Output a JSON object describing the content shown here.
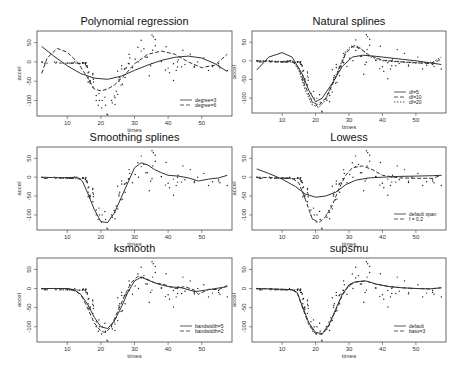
{
  "figure": {
    "width": 470,
    "height": 371,
    "background": "#ffffff",
    "line_color": "#333333",
    "point_color": "#222222"
  },
  "chart_data": [
    {
      "type": "scatter",
      "title": "Polynomial regression",
      "xlabel": "times",
      "ylabel": "accel",
      "xlim": [
        1,
        59
      ],
      "ylim": [
        -140,
        80
      ],
      "xticks": [
        10,
        20,
        30,
        40,
        50
      ],
      "yticks": [
        50,
        0,
        -50,
        -100
      ],
      "frame": {
        "x": 37,
        "y": 31,
        "w": 195,
        "h": 85
      },
      "legend": {
        "position": "bottom-right",
        "entries": [
          {
            "label": "degree=3",
            "style": "solid"
          },
          {
            "label": "degree=6",
            "style": "dashed"
          }
        ]
      },
      "series": [
        {
          "name": "degree=3",
          "style": "solid",
          "x": [
            2.4,
            6,
            10,
            14,
            18,
            22,
            26,
            30,
            34,
            38,
            42,
            46,
            50,
            54,
            57.6
          ],
          "y": [
            40,
            15,
            -10,
            -30,
            -42,
            -45,
            -37,
            -22,
            -8,
            4,
            12,
            15,
            10,
            -5,
            -25
          ]
        },
        {
          "name": "degree=6",
          "style": "dashed",
          "x": [
            2.4,
            4,
            7,
            10,
            13,
            16,
            18,
            20,
            22,
            24,
            27,
            30,
            34,
            38,
            42,
            46,
            50,
            54,
            57.6
          ],
          "y": [
            -30,
            10,
            35,
            25,
            0,
            -40,
            -70,
            -75,
            -70,
            -60,
            -35,
            -5,
            20,
            28,
            20,
            0,
            -15,
            -8,
            20
          ]
        }
      ]
    },
    {
      "type": "scatter",
      "title": "Natural splines",
      "xlabel": "times",
      "ylabel": "accel",
      "xlim": [
        1,
        59
      ],
      "ylim": [
        -140,
        80
      ],
      "xticks": [
        10,
        20,
        30,
        40,
        50
      ],
      "yticks": [
        50,
        0,
        -50,
        -100
      ],
      "frame": {
        "x": 252,
        "y": 31,
        "w": 194,
        "h": 82
      },
      "legend": {
        "position": "bottom-right",
        "entries": [
          {
            "label": "df=5",
            "style": "solid"
          },
          {
            "label": "df=10",
            "style": "dashed"
          },
          {
            "label": "df=20",
            "style": "dotted"
          }
        ]
      },
      "series": [
        {
          "name": "df=5",
          "style": "solid",
          "x": [
            2.4,
            6,
            10,
            13,
            16,
            18,
            20,
            22,
            25,
            28,
            31,
            34,
            38,
            42,
            46,
            50,
            54,
            57.6
          ],
          "y": [
            -25,
            10,
            22,
            10,
            -35,
            -80,
            -110,
            -100,
            -60,
            -15,
            10,
            15,
            12,
            8,
            4,
            0,
            -5,
            -10
          ]
        },
        {
          "name": "df=10",
          "style": "dashed",
          "x": [
            2.4,
            6,
            10,
            13,
            15,
            17,
            19,
            21,
            23,
            25,
            27,
            29,
            31,
            33,
            36,
            40,
            45,
            50,
            55,
            57.6
          ],
          "y": [
            0,
            -2,
            -3,
            0,
            -20,
            -70,
            -110,
            -120,
            -100,
            -65,
            -25,
            20,
            38,
            35,
            15,
            2,
            -2,
            -5,
            -8,
            5
          ]
        },
        {
          "name": "df=20",
          "style": "dotted",
          "x": [
            2.4,
            6,
            10,
            13,
            15,
            17,
            19,
            21,
            23,
            25,
            27,
            29,
            31,
            33,
            36,
            40,
            45,
            50,
            55,
            57.6
          ],
          "y": [
            0,
            0,
            -2,
            2,
            -25,
            -80,
            -118,
            -125,
            -105,
            -60,
            -20,
            25,
            42,
            38,
            12,
            0,
            -3,
            -6,
            -4,
            10
          ]
        }
      ]
    },
    {
      "type": "scatter",
      "title": "Smoothing splines",
      "xlabel": "times",
      "ylabel": "accel",
      "xlim": [
        1,
        59
      ],
      "ylim": [
        -140,
        80
      ],
      "xticks": [
        10,
        20,
        30,
        40,
        50
      ],
      "yticks": [
        50,
        0,
        -50,
        -100
      ],
      "frame": {
        "x": 37,
        "y": 147,
        "w": 195,
        "h": 83
      },
      "series": [
        {
          "name": "smooth.spline",
          "style": "solid",
          "x": [
            2.4,
            6,
            10,
            13,
            14.5,
            16,
            18,
            20,
            22,
            24,
            26,
            28,
            30,
            32,
            34,
            36,
            38,
            40,
            43,
            46,
            49,
            52,
            55,
            57.6
          ],
          "y": [
            0,
            -1,
            -1,
            0,
            -10,
            -40,
            -85,
            -118,
            -120,
            -95,
            -55,
            -15,
            25,
            38,
            32,
            20,
            12,
            5,
            3,
            -2,
            -10,
            -5,
            -2,
            5
          ]
        }
      ]
    },
    {
      "type": "scatter",
      "title": "Lowess",
      "xlabel": "times",
      "ylabel": "accel",
      "xlim": [
        1,
        59
      ],
      "ylim": [
        -140,
        80
      ],
      "xticks": [
        10,
        20,
        30,
        40,
        50
      ],
      "yticks": [
        50,
        0,
        -50,
        -100
      ],
      "frame": {
        "x": 252,
        "y": 147,
        "w": 194,
        "h": 83
      },
      "legend": {
        "position": "bottom-right",
        "entries": [
          {
            "label": "default span",
            "style": "solid"
          },
          {
            "label": "f = 0.2",
            "style": "dashed"
          }
        ]
      },
      "series": [
        {
          "name": "default span",
          "style": "solid",
          "x": [
            2.4,
            6,
            10,
            14,
            17,
            20,
            23,
            26,
            29,
            32,
            36,
            40,
            45,
            50,
            55,
            57.6
          ],
          "y": [
            22,
            10,
            -5,
            -25,
            -45,
            -53,
            -50,
            -40,
            -20,
            -8,
            -2,
            0,
            2,
            3,
            4,
            5
          ]
        },
        {
          "name": "f = 0.2",
          "style": "dashed",
          "x": [
            2.4,
            6,
            10,
            13,
            15,
            17,
            19,
            21,
            23,
            25,
            27,
            29,
            31,
            34,
            37,
            40,
            45,
            50,
            55,
            57.6
          ],
          "y": [
            0,
            -1,
            -2,
            -3,
            -15,
            -60,
            -110,
            -120,
            -105,
            -75,
            -30,
            5,
            25,
            30,
            20,
            5,
            -2,
            -3,
            -3,
            5
          ]
        }
      ]
    },
    {
      "type": "scatter",
      "title": "ksmooth",
      "xlabel": "times",
      "ylabel": "accel",
      "xlim": [
        1,
        59
      ],
      "ylim": [
        -140,
        80
      ],
      "xticks": [
        10,
        20,
        30,
        40,
        50
      ],
      "yticks": [
        50,
        0,
        -50,
        -100
      ],
      "frame": {
        "x": 37,
        "y": 258,
        "w": 195,
        "h": 84
      },
      "legend": {
        "position": "bottom-right",
        "entries": [
          {
            "label": "bandwidth=5",
            "style": "solid"
          },
          {
            "label": "bandwidth=2",
            "style": "dashed"
          }
        ]
      },
      "series": [
        {
          "name": "bandwidth=5",
          "style": "solid",
          "x": [
            2.4,
            6,
            10,
            12,
            14,
            16,
            18,
            20,
            22,
            24,
            26,
            28,
            30,
            32,
            34,
            37,
            40,
            44,
            48,
            52,
            57.6
          ],
          "y": [
            0,
            0,
            0,
            -3,
            -15,
            -40,
            -75,
            -100,
            -105,
            -85,
            -50,
            -10,
            20,
            30,
            22,
            12,
            5,
            2,
            -8,
            -3,
            5
          ]
        },
        {
          "name": "bandwidth=2",
          "style": "dashed",
          "x": [
            2.4,
            6,
            10,
            12,
            14,
            16,
            18,
            20,
            21.5,
            23,
            25,
            27,
            29,
            31,
            33,
            36,
            39,
            42,
            45,
            48,
            49,
            52,
            55,
            57.6
          ],
          "y": [
            0,
            0,
            0,
            -5,
            -15,
            -50,
            -90,
            -112,
            -115,
            -100,
            -60,
            -20,
            15,
            32,
            28,
            15,
            10,
            0,
            5,
            -5,
            -15,
            -2,
            -3,
            8
          ]
        }
      ]
    },
    {
      "type": "scatter",
      "title": "supsmu",
      "xlabel": "times",
      "ylabel": "accel",
      "xlim": [
        1,
        59
      ],
      "ylim": [
        -140,
        80
      ],
      "xticks": [
        10,
        20,
        30,
        40,
        50
      ],
      "yticks": [
        50,
        0,
        -50,
        -100
      ],
      "frame": {
        "x": 252,
        "y": 258,
        "w": 194,
        "h": 84
      },
      "legend": {
        "position": "bottom-right",
        "entries": [
          {
            "label": "default",
            "style": "solid"
          },
          {
            "label": "bass=3",
            "style": "dashed"
          }
        ]
      },
      "series": [
        {
          "name": "default",
          "style": "solid",
          "x": [
            2.4,
            6,
            10,
            13,
            14.5,
            16,
            18,
            20,
            22,
            24,
            26,
            28,
            30,
            32,
            35,
            38,
            42,
            46,
            50,
            54,
            57.6
          ],
          "y": [
            0,
            -1,
            -2,
            -3,
            -10,
            -45,
            -90,
            -115,
            -118,
            -95,
            -55,
            -15,
            10,
            18,
            20,
            12,
            5,
            2,
            0,
            -1,
            2
          ]
        },
        {
          "name": "bass=3",
          "style": "dashed",
          "x": [
            2.4,
            6,
            10,
            13,
            14.5,
            16,
            18,
            20,
            22,
            24,
            26,
            28,
            30,
            32,
            35,
            38,
            42,
            46,
            50,
            54,
            57.6
          ],
          "y": [
            0,
            -1,
            -2,
            -3,
            -12,
            -48,
            -95,
            -118,
            -120,
            -98,
            -58,
            -18,
            8,
            17,
            20,
            12,
            5,
            2,
            0,
            -1,
            2
          ]
        }
      ]
    }
  ],
  "scatter_points": {
    "x": [
      2.4,
      2.6,
      3.2,
      3.6,
      4,
      6.2,
      6.6,
      6.8,
      7.8,
      8.2,
      8.8,
      9.6,
      10,
      10.2,
      10.6,
      11,
      11.4,
      11.4,
      11.4,
      11.8,
      12.2,
      12.6,
      13.2,
      13.6,
      13.8,
      14.6,
      14.6,
      14.6,
      14.6,
      14.6,
      14.8,
      15.4,
      15.4,
      15.4,
      15.4,
      15.6,
      15.6,
      15.8,
      15.8,
      16,
      16,
      16.2,
      16.2,
      16.2,
      16.4,
      16.6,
      16.8,
      16.8,
      16.8,
      17.6,
      17.6,
      17.6,
      17.6,
      17.8,
      17.8,
      18.6,
      18.6,
      19.2,
      19.4,
      19.6,
      20.2,
      20.4,
      21.2,
      21.4,
      21.8,
      22,
      23.2,
      23.4,
      24,
      24.2,
      24.2,
      24.6,
      25,
      25,
      25.4,
      25.4,
      25.6,
      26,
      26.2,
      26.2,
      26.4,
      27,
      27.2,
      27.2,
      27.6,
      28.2,
      28.4,
      28.4,
      28.6,
      29.4,
      30.2,
      31,
      31.2,
      32,
      32,
      32.8,
      33.4,
      33.8,
      34.4,
      34.8,
      35.2,
      35.2,
      35.4,
      35.6,
      36.2,
      36.2,
      38,
      38,
      39.2,
      39.4,
      40,
      40.4,
      41.6,
      41.6,
      42.4,
      42.8,
      42.8,
      43,
      44,
      44.4,
      45,
      46.6,
      47.8,
      47.8,
      48.8,
      50.6,
      52,
      53.2,
      55,
      55,
      55.4,
      57.6
    ],
    "y": [
      0,
      -1,
      -3,
      -3,
      -3,
      0,
      -3,
      -1,
      -3,
      -3,
      -3,
      -3,
      -3,
      -3,
      -3,
      -3,
      -3,
      -3,
      -3,
      -2.7,
      0,
      -3,
      -4,
      -4,
      -4,
      -2,
      -3,
      -3,
      -3,
      -3,
      -2,
      -5,
      -5,
      -5,
      -2,
      -10,
      -2,
      -10,
      -10,
      -14,
      -14,
      -28,
      -40,
      -52,
      -26,
      -50,
      -51,
      -48,
      -55,
      -30,
      -41,
      -65,
      -33,
      -45,
      -52,
      -87,
      -100,
      -112,
      -82,
      -100,
      -119,
      -100,
      -91,
      -112,
      -135,
      -137,
      -100,
      -106,
      -88,
      -93,
      -110,
      -76,
      -24,
      -84,
      -50,
      -45,
      -40,
      -60,
      -10,
      -18,
      -58,
      -19,
      -17,
      -40,
      -15,
      -4,
      20,
      -5,
      10,
      -15,
      7,
      38,
      0,
      28,
      56,
      34,
      12,
      12,
      -36,
      -10,
      -4,
      70,
      30,
      65,
      42,
      58,
      1,
      2,
      -21,
      39,
      -16,
      -28,
      -48,
      -5,
      -22,
      -13,
      0,
      5,
      -13,
      30,
      -7,
      20,
      -14,
      -11,
      0,
      10,
      -22,
      -12,
      -5,
      -10,
      -15,
      -22,
      15,
      6,
      4,
      27,
      -2
    ]
  }
}
